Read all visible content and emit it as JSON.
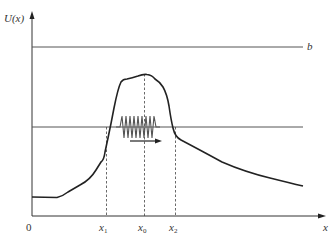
{
  "diagram": {
    "y_axis_label": "U(x)",
    "x_axis_label": "x",
    "origin_label": "0",
    "level_b_label": "b",
    "ticks": [
      {
        "name": "x1",
        "base": "x",
        "sub": "1"
      },
      {
        "name": "x0",
        "base": "x",
        "sub": "0"
      },
      {
        "name": "x2",
        "base": "x",
        "sub": "2"
      }
    ],
    "elements": [
      "y-axis with arrow",
      "x-axis with arrow",
      "horizontal level line b (high)",
      "horizontal energy level line (middle)",
      "potential barrier curve U(x)",
      "wave packet oscillation between x1 and x2",
      "arrow indicating propagation to the right",
      "dashed vertical guides at x1, x0, x2"
    ],
    "colors": {
      "curve": "#222222",
      "lines": "#555555",
      "text": "#333333"
    }
  }
}
